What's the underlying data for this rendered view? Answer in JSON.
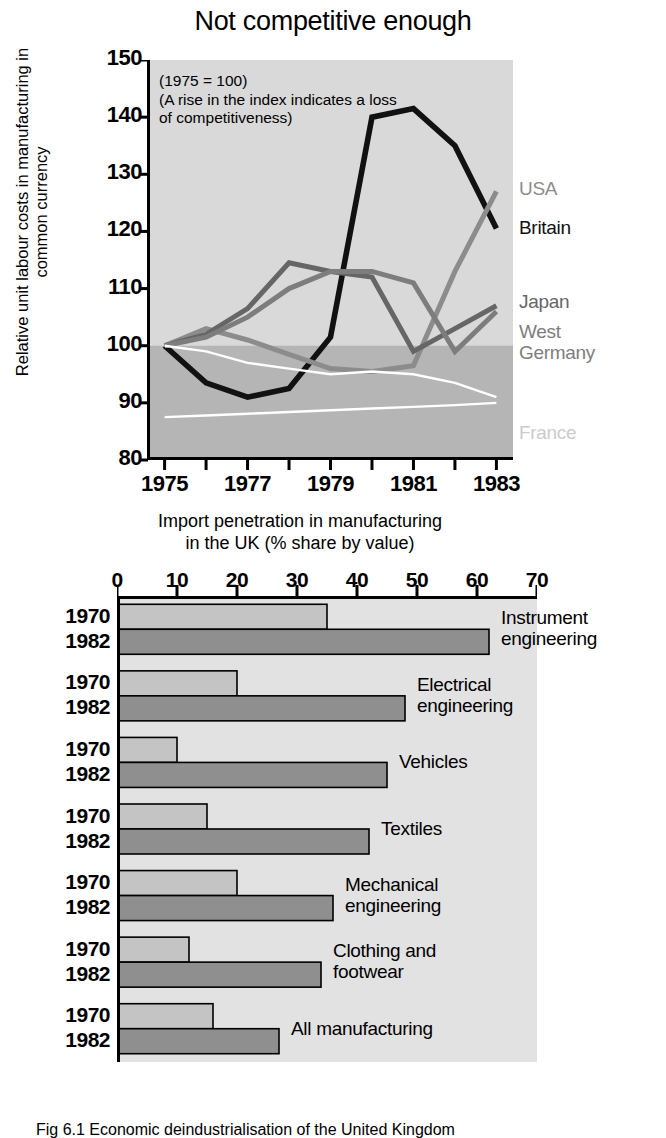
{
  "caption": "Fig 6.1 Economic deindustrialisation of the United Kingdom",
  "line_figure": {
    "title": "Not competitive enough",
    "ylabel": "Relative unit labour costs in manufacturing\nin common currency",
    "annotation": "(1975 = 100)\n(A rise in the index indicates a loss\nof competitiveness)",
    "series_labels": {
      "usa": "USA",
      "britain": "Britain",
      "japan": "Japan",
      "west_germany": "West\nGermany",
      "france": "France"
    }
  },
  "bar_figure": {
    "title": "Import penetration in manufacturing\nin the UK (% share by value)",
    "year_early": "1970",
    "year_late": "1982"
  },
  "colors": {
    "plot_background": "#d9d9d9",
    "plot_background_lower": "#b5b5b5",
    "britain": "#111111",
    "usa": "#8c8c8c",
    "japan": "#666666",
    "west_germany": "#7d7d7d",
    "france": "#ffffff",
    "bar_early": "#c4c4c4",
    "bar_late": "#8f8f8f",
    "axis": "#000000"
  },
  "chart_data": [
    {
      "type": "line",
      "title": "Not competitive enough",
      "xlabel": "",
      "ylabel": "Relative unit labour costs in manufacturing in common currency",
      "annotation": "(1975 = 100) (A rise in the index indicates a loss of competitiveness)",
      "grid": false,
      "legend_position": "right-of-plot",
      "x": [
        1975,
        1976,
        1977,
        1978,
        1979,
        1980,
        1981,
        1982,
        1983
      ],
      "xlim": [
        1974.6,
        1983.4
      ],
      "ylim": [
        80,
        150
      ],
      "xticks": [
        1975,
        1976,
        1977,
        1978,
        1979,
        1980,
        1981,
        1982,
        1983
      ],
      "xticklabels": [
        "1975",
        "",
        "1977",
        "",
        "1979",
        "",
        "1981",
        "",
        "1983"
      ],
      "yticks": [
        80,
        90,
        100,
        110,
        120,
        130,
        140,
        150
      ],
      "yticklabels": [
        "80",
        "90",
        "100",
        "110",
        "120",
        "130",
        "140",
        "150"
      ],
      "series": [
        {
          "name": "Britain",
          "color": "#111111",
          "values": [
            100,
            93.5,
            91,
            92.5,
            101.5,
            140,
            141.5,
            135,
            120.5
          ]
        },
        {
          "name": "USA",
          "color": "#8c8c8c",
          "values": [
            100,
            103,
            101,
            98.5,
            96,
            95.5,
            96.5,
            113,
            127
          ]
        },
        {
          "name": "Japan",
          "color": "#666666",
          "values": [
            100,
            102,
            106.5,
            114.5,
            113,
            112,
            99,
            103,
            107
          ]
        },
        {
          "name": "West Germany",
          "color": "#7d7d7d",
          "values": [
            100,
            101.5,
            105,
            110,
            113,
            113,
            111,
            99,
            106
          ]
        },
        {
          "name": "France",
          "color": "#ffffff",
          "values": [
            100,
            99,
            97,
            96,
            95,
            95.5,
            95,
            93.5,
            91
          ]
        },
        {
          "name": "France baseline",
          "color": "#ffffff",
          "values": [
            87.5,
            87.8,
            88.1,
            88.4,
            88.7,
            89,
            89.3,
            89.6,
            90
          ]
        }
      ]
    },
    {
      "type": "bar",
      "orientation": "horizontal",
      "title": "Import penetration in manufacturing in the UK (% share by value)",
      "xlabel": "",
      "ylabel": "",
      "xlim": [
        0,
        70
      ],
      "xticks": [
        0,
        10,
        20,
        30,
        40,
        50,
        60,
        70
      ],
      "xticklabels": [
        "0",
        "10",
        "20",
        "30",
        "40",
        "50",
        "60",
        "70"
      ],
      "categories": [
        "Instrument\nengineering",
        "Electrical\nengineering",
        "Vehicles",
        "Textiles",
        "Mechanical\nengineering",
        "Clothing and\nfootwear",
        "All manufacturing"
      ],
      "series": [
        {
          "name": "1970",
          "color": "#c4c4c4",
          "values": [
            35,
            20,
            10,
            15,
            20,
            12,
            16
          ]
        },
        {
          "name": "1982",
          "color": "#8f8f8f",
          "values": [
            62,
            48,
            45,
            42,
            36,
            34,
            27
          ]
        }
      ]
    }
  ]
}
